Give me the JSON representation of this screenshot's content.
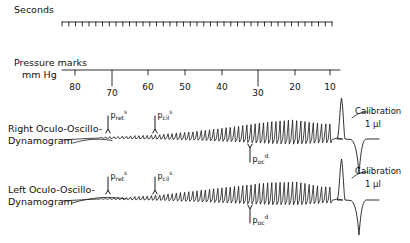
{
  "figure": {
    "seconds_label": "Seconds",
    "pressure_label_line1": "Pressure marks",
    "pressure_label_line2": "mm Hg",
    "right_trace_line1": "Right Oculo-Oscillo-",
    "right_trace_line2": "Dynamogram",
    "left_trace_line1": "Left Oculo-Oscillo-",
    "left_trace_line2": "Dynamogram",
    "calibration_top_line1": "Calibration",
    "calibration_top_line2": "1 µl",
    "calibration_bottom_line1": "Calibration",
    "calibration_bottom_line2": "1 µl",
    "ink_color": "#1a1a1a",
    "background_color": "#ffffff"
  },
  "chart_data": {
    "type": "line",
    "xlabel": "Pressure marks mm Hg",
    "ylabel": "",
    "axis_ticks": [
      80,
      70,
      60,
      50,
      40,
      30,
      20,
      10
    ],
    "axis_tick_x": [
      75,
      112,
      148,
      185,
      222,
      258,
      295,
      330
    ],
    "axis_major_ticks": [
      70,
      30
    ],
    "axis_direction": "decreasing-left-to-right",
    "seconds_scale": {
      "label": "Seconds",
      "x_start": 62,
      "x_end": 332,
      "tick_count": 40,
      "tick_interval_seconds": 1
    },
    "series": [
      {
        "name": "Right Oculo-Oscillo-Dynamogram",
        "baseline_y": 138,
        "markers": [
          {
            "label": "p",
            "sub": "ret",
            "sup": "s",
            "x": 108,
            "arrow": "down",
            "pressure_mm_hg": 71
          },
          {
            "label": "p",
            "sub": "cil",
            "sup": "s",
            "x": 155,
            "arrow": "down",
            "pressure_mm_hg": 58
          },
          {
            "label": "p",
            "sub": "oc",
            "sup": "d",
            "x": 250,
            "arrow": "up",
            "pressure_mm_hg": 32
          }
        ],
        "envelope": [
          {
            "x": 90,
            "amplitude": 0.5
          },
          {
            "x": 120,
            "amplitude": 1.5
          },
          {
            "x": 155,
            "amplitude": 3
          },
          {
            "x": 190,
            "amplitude": 6
          },
          {
            "x": 225,
            "amplitude": 10
          },
          {
            "x": 260,
            "amplitude": 15
          },
          {
            "x": 290,
            "amplitude": 18
          },
          {
            "x": 320,
            "amplitude": 14
          }
        ],
        "calibration_pulse": {
          "x": 345,
          "amplitude_ul": 1
        }
      },
      {
        "name": "Left Oculo-Oscillo-Dynamogram",
        "baseline_y": 199,
        "markers": [
          {
            "label": "p",
            "sub": "ret",
            "sup": "s",
            "x": 108,
            "arrow": "down",
            "pressure_mm_hg": 71
          },
          {
            "label": "p",
            "sub": "cil",
            "sup": "s",
            "x": 155,
            "arrow": "down",
            "pressure_mm_hg": 58
          },
          {
            "label": "p",
            "sub": "oc",
            "sup": "d",
            "x": 250,
            "arrow": "up",
            "pressure_mm_hg": 32
          }
        ],
        "envelope": [
          {
            "x": 95,
            "amplitude": 0.5
          },
          {
            "x": 125,
            "amplitude": 1.5
          },
          {
            "x": 160,
            "amplitude": 4
          },
          {
            "x": 195,
            "amplitude": 8
          },
          {
            "x": 230,
            "amplitude": 12
          },
          {
            "x": 265,
            "amplitude": 16
          },
          {
            "x": 295,
            "amplitude": 17
          },
          {
            "x": 320,
            "amplitude": 12
          }
        ],
        "calibration_pulse": {
          "x": 345,
          "amplitude_ul": 1
        }
      }
    ],
    "grid": false,
    "legend": "none"
  }
}
